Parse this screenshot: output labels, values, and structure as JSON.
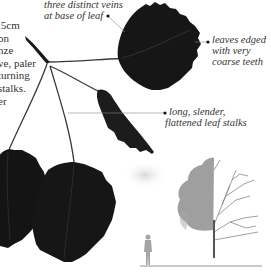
{
  "description": {
    "lines": [
      ".5cm",
      "on",
      "nze",
      "ve, paler",
      "turning",
      "stalks.",
      "er"
    ]
  },
  "annotations": {
    "veins": {
      "line1": "three distinct veins",
      "line2": "at base of leaf"
    },
    "edges": {
      "line1": "leaves edged",
      "line2": "with very",
      "line3": "coarse teeth"
    },
    "stalks": {
      "line1": "long, slender,",
      "line2": "flattened leaf stalks"
    }
  },
  "illustration": {
    "subjects": [
      "leaf-spray",
      "tree-silhouette",
      "human-scale-figure"
    ],
    "colors": {
      "leaf": "#161616",
      "text": "#333333",
      "tree_foliage": "#8a8a8a",
      "figure": "#a0a0a0"
    }
  }
}
